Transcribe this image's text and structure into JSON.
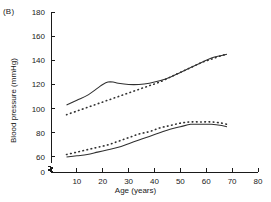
{
  "figure": {
    "panel_label": "(B)",
    "background_color": "#ffffff",
    "ink_color": "#1a1a1a"
  },
  "chart_data": {
    "type": "line",
    "title": "",
    "panel": "(B)",
    "xlabel": "Age (years)",
    "ylabel": "Blood pressure (mmHg)",
    "xlim": [
      0,
      80
    ],
    "ylim": [
      0,
      180
    ],
    "y_axis_break": true,
    "y_break_between": [
      0,
      55
    ],
    "grid": false,
    "legend_position": "none",
    "xticks": [
      10,
      20,
      30,
      40,
      50,
      60,
      70,
      80
    ],
    "xticklabels": [
      "10",
      "20",
      "30",
      "40",
      "50",
      "60",
      "70",
      "80"
    ],
    "yticks": [
      0,
      60,
      80,
      100,
      120,
      140,
      160,
      180
    ],
    "yticklabels": [
      "0",
      "60",
      "80",
      "100",
      "120",
      "140",
      "160",
      "180"
    ],
    "series": [
      {
        "name": "Systolic - solid",
        "style": "solid",
        "color": "#303030",
        "x": [
          6,
          10,
          14,
          18,
          20,
          22,
          24,
          26,
          30,
          34,
          38,
          42,
          46,
          50,
          54,
          58,
          62,
          66,
          68
        ],
        "values": [
          103,
          107,
          111,
          117,
          120,
          122,
          122,
          121,
          120,
          120,
          121,
          123,
          126,
          130,
          134,
          138,
          142,
          144,
          145
        ]
      },
      {
        "name": "Systolic - dotted",
        "style": "dotted",
        "color": "#303030",
        "x": [
          6,
          10,
          14,
          18,
          22,
          26,
          30,
          34,
          38,
          42,
          46,
          50,
          54,
          58,
          62,
          66,
          68
        ],
        "values": [
          95,
          98,
          101,
          104,
          107,
          110,
          113,
          116,
          119,
          122,
          126,
          130,
          134,
          138,
          141,
          144,
          145
        ]
      },
      {
        "name": "Diastolic - solid",
        "style": "solid",
        "color": "#303030",
        "x": [
          6,
          10,
          14,
          18,
          22,
          26,
          30,
          34,
          38,
          42,
          46,
          50,
          54,
          58,
          62,
          66,
          68
        ],
        "values": [
          60,
          61,
          62,
          64,
          66,
          68,
          71,
          74,
          77,
          80,
          83,
          85,
          87,
          87,
          87,
          86,
          85
        ]
      },
      {
        "name": "Diastolic - dotted",
        "style": "dotted",
        "color": "#303030",
        "x": [
          6,
          10,
          14,
          18,
          22,
          26,
          30,
          34,
          38,
          42,
          46,
          50,
          54,
          58,
          62,
          66,
          68
        ],
        "values": [
          62,
          64,
          66,
          68,
          70,
          73,
          76,
          79,
          81,
          84,
          86,
          88,
          89,
          89,
          89,
          88,
          87
        ]
      }
    ]
  }
}
